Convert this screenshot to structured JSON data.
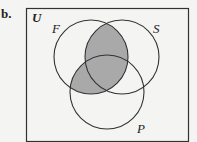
{
  "problem_label": "b.",
  "universe_label": "U",
  "sets": [
    {
      "name": "F"
    },
    {
      "name": "S"
    },
    {
      "name": "P"
    }
  ],
  "shaded_region": "F ∩ (S ∪ P)",
  "colors": {
    "shade": "#a9a9a9",
    "line": "#333333",
    "background": "#f4f4f2"
  }
}
